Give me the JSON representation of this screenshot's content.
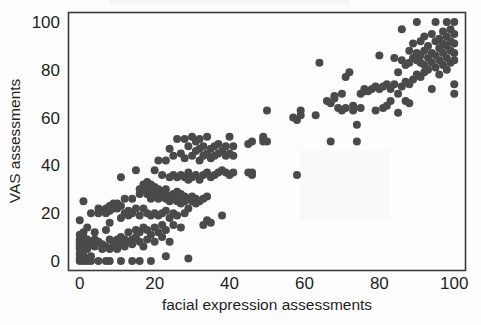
{
  "chart_data": {
    "type": "scatter",
    "title": "",
    "xlabel": "facial expression assessments",
    "ylabel": "VAS assessments",
    "xlim": [
      -3,
      103
    ],
    "ylim": [
      -4,
      104
    ],
    "xticks": [
      0,
      20,
      40,
      60,
      80,
      100
    ],
    "yticks": [
      0,
      20,
      40,
      60,
      80,
      100
    ],
    "xtick_labels": [
      "0",
      "20",
      "40",
      "60",
      "80",
      "100"
    ],
    "ytick_labels": [
      "0",
      "20",
      "40",
      "60",
      "80",
      "100"
    ],
    "grid": false,
    "legend": null,
    "marker": {
      "shape": "circle",
      "color": "#4a4a4a",
      "size_px": 8
    },
    "frame": {
      "color": "#3a3a3a",
      "box": true
    },
    "n_points": 248,
    "correlation_note": "strong positive association",
    "points": [
      [
        0,
        0
      ],
      [
        0,
        1
      ],
      [
        0,
        3
      ],
      [
        0,
        5
      ],
      [
        0,
        6
      ],
      [
        0,
        7
      ],
      [
        0,
        8
      ],
      [
        0,
        9
      ],
      [
        0,
        11
      ],
      [
        0,
        17
      ],
      [
        1,
        0
      ],
      [
        1,
        2
      ],
      [
        1,
        4
      ],
      [
        1,
        6
      ],
      [
        1,
        7
      ],
      [
        1,
        9
      ],
      [
        1,
        10
      ],
      [
        1,
        12
      ],
      [
        1,
        25
      ],
      [
        2,
        0
      ],
      [
        2,
        1
      ],
      [
        2,
        5
      ],
      [
        2,
        6
      ],
      [
        2,
        8
      ],
      [
        2,
        9
      ],
      [
        2,
        14
      ],
      [
        3,
        0
      ],
      [
        3,
        2
      ],
      [
        3,
        7
      ],
      [
        3,
        8
      ],
      [
        3,
        20
      ],
      [
        4,
        6
      ],
      [
        4,
        9
      ],
      [
        4,
        12
      ],
      [
        5,
        0
      ],
      [
        5,
        8
      ],
      [
        5,
        20
      ],
      [
        5,
        22
      ],
      [
        6,
        5
      ],
      [
        6,
        7
      ],
      [
        6,
        21
      ],
      [
        7,
        0
      ],
      [
        7,
        6
      ],
      [
        7,
        13
      ],
      [
        7,
        20
      ],
      [
        7,
        22
      ],
      [
        8,
        0
      ],
      [
        8,
        5
      ],
      [
        8,
        9
      ],
      [
        8,
        16
      ],
      [
        8,
        21
      ],
      [
        8,
        23
      ],
      [
        9,
        6
      ],
      [
        9,
        8
      ],
      [
        9,
        22
      ],
      [
        9,
        24
      ],
      [
        10,
        5
      ],
      [
        10,
        9
      ],
      [
        10,
        22
      ],
      [
        10,
        24
      ],
      [
        11,
        0
      ],
      [
        11,
        7
      ],
      [
        11,
        10
      ],
      [
        11,
        18
      ],
      [
        11,
        23
      ],
      [
        11,
        35
      ],
      [
        12,
        6
      ],
      [
        12,
        9
      ],
      [
        12,
        20
      ],
      [
        12,
        26
      ],
      [
        13,
        8
      ],
      [
        13,
        12
      ],
      [
        13,
        19
      ],
      [
        13,
        21
      ],
      [
        14,
        0
      ],
      [
        14,
        7
      ],
      [
        14,
        9
      ],
      [
        14,
        20
      ],
      [
        14,
        26
      ],
      [
        15,
        10
      ],
      [
        15,
        13
      ],
      [
        15,
        22
      ],
      [
        15,
        38
      ],
      [
        16,
        0
      ],
      [
        16,
        8
      ],
      [
        16,
        12
      ],
      [
        16,
        19
      ],
      [
        16,
        28
      ],
      [
        16,
        30
      ],
      [
        17,
        6
      ],
      [
        17,
        14
      ],
      [
        17,
        22
      ],
      [
        17,
        30
      ],
      [
        17,
        32
      ],
      [
        18,
        9
      ],
      [
        18,
        13
      ],
      [
        18,
        20
      ],
      [
        18,
        28
      ],
      [
        18,
        31
      ],
      [
        18,
        33
      ],
      [
        19,
        0
      ],
      [
        19,
        11
      ],
      [
        19,
        19
      ],
      [
        19,
        26
      ],
      [
        19,
        30
      ],
      [
        19,
        32
      ],
      [
        20,
        8
      ],
      [
        20,
        14
      ],
      [
        20,
        20
      ],
      [
        20,
        27
      ],
      [
        20,
        29
      ],
      [
        20,
        31
      ],
      [
        20,
        38
      ],
      [
        21,
        12
      ],
      [
        21,
        19
      ],
      [
        21,
        26
      ],
      [
        21,
        28
      ],
      [
        21,
        30
      ],
      [
        21,
        42
      ],
      [
        22,
        10
      ],
      [
        22,
        15
      ],
      [
        22,
        20
      ],
      [
        22,
        27
      ],
      [
        22,
        29
      ],
      [
        22,
        36
      ],
      [
        23,
        2
      ],
      [
        23,
        13
      ],
      [
        23,
        21
      ],
      [
        23,
        26
      ],
      [
        23,
        28
      ],
      [
        23,
        30
      ],
      [
        23,
        42
      ],
      [
        24,
        8
      ],
      [
        24,
        18
      ],
      [
        24,
        25
      ],
      [
        24,
        27
      ],
      [
        24,
        35
      ],
      [
        24,
        47
      ],
      [
        25,
        15
      ],
      [
        25,
        20
      ],
      [
        25,
        26
      ],
      [
        25,
        28
      ],
      [
        25,
        36
      ],
      [
        25,
        44
      ],
      [
        26,
        19
      ],
      [
        26,
        25
      ],
      [
        26,
        27
      ],
      [
        26,
        29
      ],
      [
        26,
        35
      ],
      [
        26,
        51
      ],
      [
        27,
        14
      ],
      [
        27,
        24
      ],
      [
        27,
        26
      ],
      [
        27,
        28
      ],
      [
        27,
        36
      ],
      [
        27,
        45
      ],
      [
        28,
        20
      ],
      [
        28,
        25
      ],
      [
        28,
        27
      ],
      [
        28,
        35
      ],
      [
        28,
        43
      ],
      [
        28,
        51
      ],
      [
        29,
        1
      ],
      [
        29,
        22
      ],
      [
        29,
        26
      ],
      [
        29,
        34
      ],
      [
        29,
        37
      ],
      [
        29,
        48
      ],
      [
        30,
        25
      ],
      [
        30,
        27
      ],
      [
        30,
        35
      ],
      [
        30,
        44
      ],
      [
        30,
        52
      ],
      [
        31,
        24
      ],
      [
        31,
        26
      ],
      [
        31,
        36
      ],
      [
        31,
        46
      ],
      [
        31,
        50
      ],
      [
        32,
        25
      ],
      [
        32,
        34
      ],
      [
        32,
        42
      ],
      [
        32,
        47
      ],
      [
        32,
        51
      ],
      [
        33,
        15
      ],
      [
        33,
        26
      ],
      [
        33,
        36
      ],
      [
        33,
        44
      ],
      [
        33,
        48
      ],
      [
        34,
        17
      ],
      [
        34,
        27
      ],
      [
        34,
        37
      ],
      [
        34,
        45
      ],
      [
        34,
        52
      ],
      [
        35,
        16
      ],
      [
        35,
        35
      ],
      [
        35,
        43
      ],
      [
        35,
        47
      ],
      [
        36,
        36
      ],
      [
        36,
        44
      ],
      [
        36,
        48
      ],
      [
        37,
        37
      ],
      [
        37,
        45
      ],
      [
        37,
        49
      ],
      [
        38,
        19
      ],
      [
        38,
        38
      ],
      [
        38,
        46
      ],
      [
        39,
        37
      ],
      [
        39,
        44
      ],
      [
        39,
        48
      ],
      [
        40,
        36
      ],
      [
        40,
        45
      ],
      [
        40,
        52
      ],
      [
        41,
        37
      ],
      [
        41,
        44
      ],
      [
        41,
        48
      ],
      [
        45,
        37
      ],
      [
        45,
        49
      ],
      [
        46,
        36
      ],
      [
        46,
        37
      ],
      [
        46,
        50
      ],
      [
        49,
        50
      ],
      [
        49,
        51
      ],
      [
        49,
        52
      ],
      [
        50,
        50
      ],
      [
        50,
        63
      ],
      [
        57,
        60
      ],
      [
        58,
        36
      ],
      [
        58,
        59
      ],
      [
        59,
        61
      ],
      [
        59,
        63
      ],
      [
        63,
        61
      ],
      [
        64,
        83
      ],
      [
        66,
        67
      ],
      [
        67,
        50
      ],
      [
        67,
        66
      ],
      [
        68,
        68
      ],
      [
        68,
        69
      ],
      [
        69,
        64
      ],
      [
        70,
        63
      ],
      [
        70,
        70
      ],
      [
        71,
        64
      ],
      [
        71,
        77
      ],
      [
        72,
        79
      ],
      [
        73,
        63
      ],
      [
        73,
        65
      ],
      [
        74,
        50
      ],
      [
        74,
        57
      ],
      [
        75,
        64
      ],
      [
        75,
        70
      ],
      [
        76,
        71
      ],
      [
        76,
        72
      ],
      [
        77,
        71
      ],
      [
        78,
        72
      ],
      [
        79,
        63
      ],
      [
        79,
        73
      ],
      [
        80,
        72
      ],
      [
        80,
        86
      ],
      [
        81,
        64
      ],
      [
        81,
        73
      ],
      [
        82,
        65
      ],
      [
        82,
        74
      ],
      [
        83,
        67
      ],
      [
        83,
        72
      ],
      [
        84,
        74
      ],
      [
        84,
        85
      ],
      [
        85,
        62
      ],
      [
        85,
        70
      ],
      [
        85,
        79
      ],
      [
        86,
        73
      ],
      [
        86,
        84
      ],
      [
        86,
        97
      ],
      [
        87,
        67
      ],
      [
        87,
        75
      ],
      [
        87,
        82
      ],
      [
        88,
        66
      ],
      [
        88,
        74
      ],
      [
        88,
        83
      ],
      [
        88,
        88
      ],
      [
        89,
        76
      ],
      [
        89,
        85
      ],
      [
        89,
        91
      ],
      [
        90,
        78
      ],
      [
        90,
        84
      ],
      [
        90,
        87
      ],
      [
        90,
        100
      ],
      [
        91,
        77
      ],
      [
        91,
        83
      ],
      [
        91,
        86
      ],
      [
        91,
        92
      ],
      [
        92,
        79
      ],
      [
        92,
        82
      ],
      [
        92,
        88
      ],
      [
        92,
        94
      ],
      [
        93,
        80
      ],
      [
        93,
        85
      ],
      [
        93,
        90
      ],
      [
        94,
        72
      ],
      [
        94,
        83
      ],
      [
        94,
        87
      ],
      [
        94,
        95
      ],
      [
        95,
        81
      ],
      [
        95,
        86
      ],
      [
        95,
        92
      ],
      [
        95,
        100
      ],
      [
        96,
        78
      ],
      [
        96,
        84
      ],
      [
        96,
        89
      ],
      [
        96,
        93
      ],
      [
        97,
        82
      ],
      [
        97,
        87
      ],
      [
        97,
        91
      ],
      [
        97,
        96
      ],
      [
        98,
        80
      ],
      [
        98,
        85
      ],
      [
        98,
        90
      ],
      [
        98,
        94
      ],
      [
        98,
        100
      ],
      [
        99,
        83
      ],
      [
        99,
        88
      ],
      [
        99,
        92
      ],
      [
        99,
        97
      ],
      [
        100,
        70
      ],
      [
        100,
        74
      ],
      [
        100,
        84
      ],
      [
        100,
        87
      ],
      [
        100,
        91
      ],
      [
        100,
        95
      ],
      [
        100,
        100
      ]
    ]
  }
}
